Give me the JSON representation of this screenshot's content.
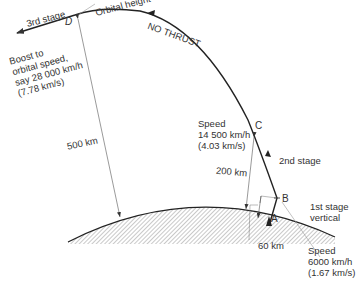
{
  "diagram": {
    "points": {
      "A": "A",
      "B": "B",
      "C": "C",
      "D": "D"
    },
    "labels": {
      "orbital_height": "Orbital height",
      "third_stage": "3rd stage",
      "no_thrust": "NO THRUST",
      "boost": [
        "Boost to",
        "orbital speed,",
        "say 28 000 km/h",
        "(7.78 km/s)"
      ],
      "speed_c": [
        "Speed",
        "14 500 km/h",
        "(4.03 km/s)"
      ],
      "second_stage": "2nd stage",
      "first_stage": [
        "1st stage",
        "vertical"
      ],
      "speed_b": [
        "Speed",
        "6000 km/h",
        "(1.67 km/s)"
      ],
      "dist_500": "500 km",
      "dist_200": "200 km",
      "dist_60": "60 km"
    },
    "colors": {
      "line": "#333333",
      "leader": "#888888",
      "background": "#ffffff"
    }
  }
}
